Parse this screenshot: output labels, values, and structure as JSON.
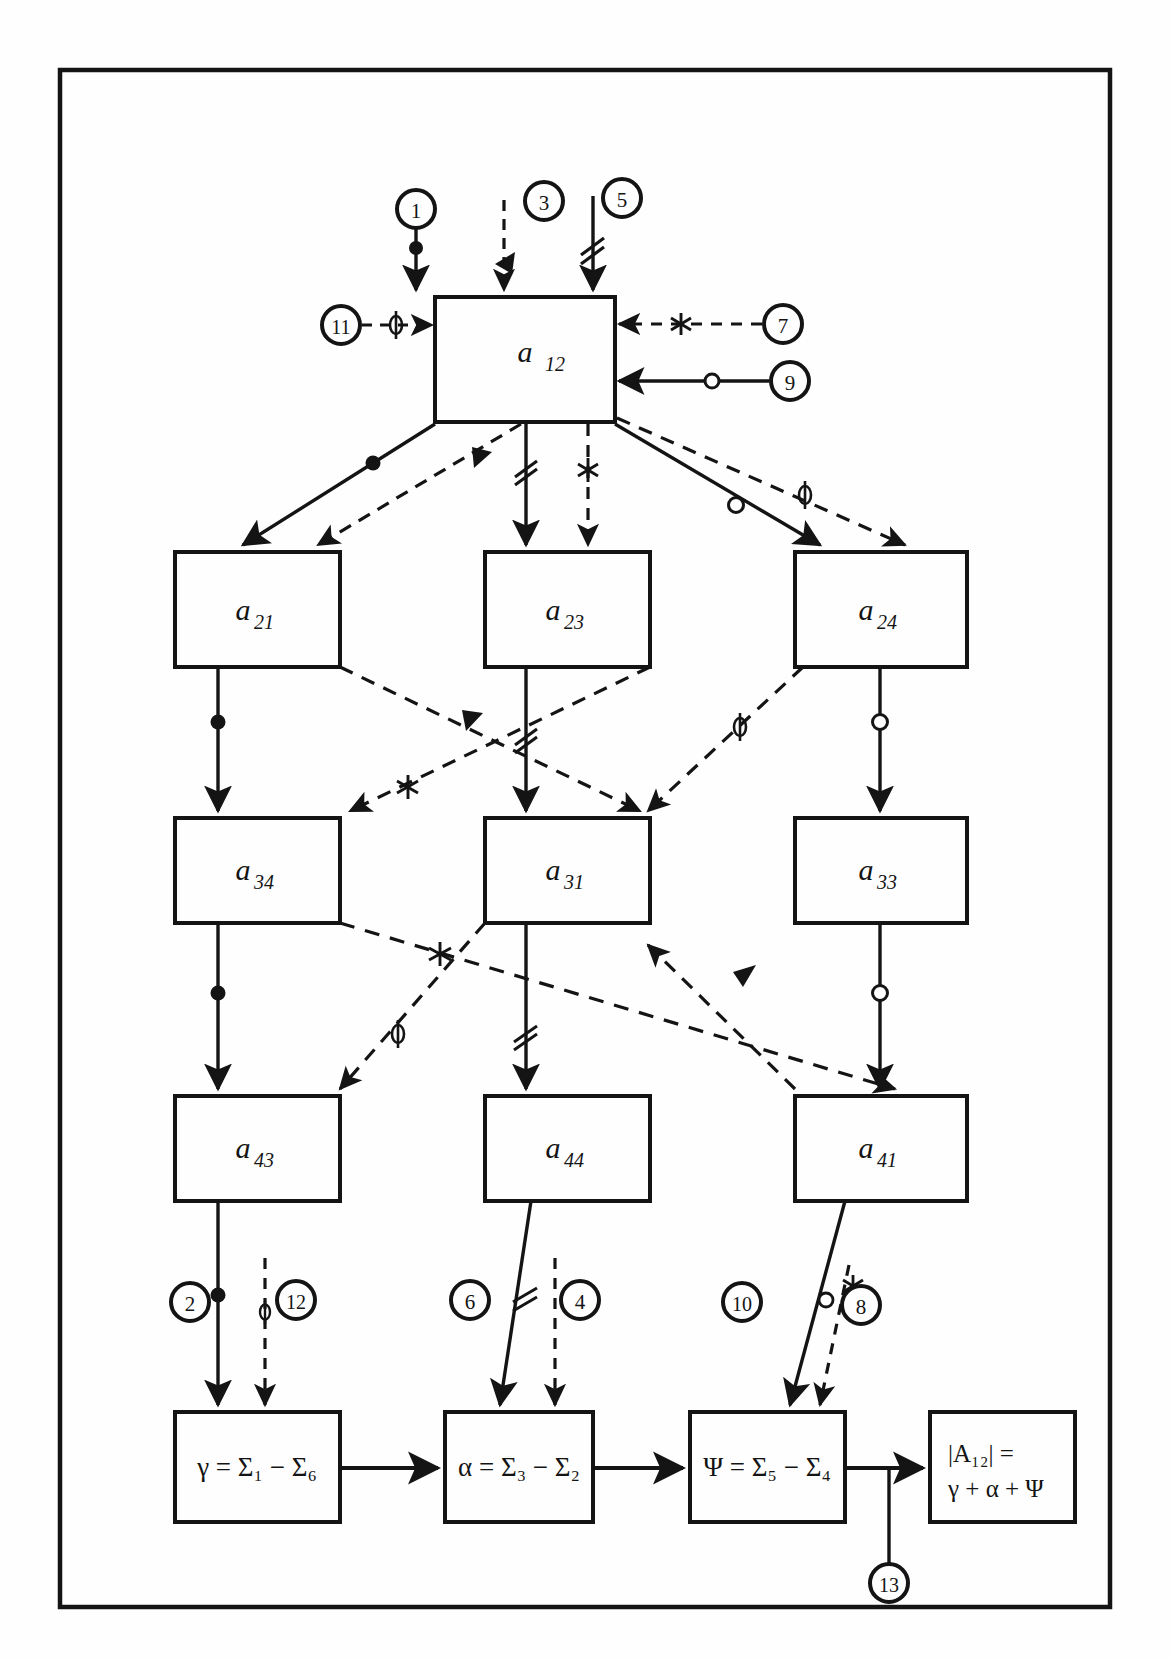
{
  "figure": {
    "type": "block-flow-diagram",
    "frame": {
      "x": 60,
      "y": 70,
      "width": 1050,
      "height": 1537
    }
  },
  "blocks": [
    {
      "id": "a12",
      "label": "a",
      "sub": "12",
      "x": 435,
      "y": 297,
      "w": 180,
      "h": 125
    },
    {
      "id": "a21",
      "label": "a",
      "sub": "21",
      "x": 175,
      "y": 552,
      "w": 165,
      "h": 115
    },
    {
      "id": "a23",
      "label": "a",
      "sub": "23",
      "x": 485,
      "y": 552,
      "w": 165,
      "h": 115
    },
    {
      "id": "a24",
      "label": "a",
      "sub": "24",
      "x": 795,
      "y": 552,
      "w": 172,
      "h": 115
    },
    {
      "id": "a34",
      "label": "a",
      "sub": "34",
      "x": 175,
      "y": 818,
      "w": 165,
      "h": 105
    },
    {
      "id": "a31",
      "label": "a",
      "sub": "31",
      "x": 485,
      "y": 818,
      "w": 165,
      "h": 105
    },
    {
      "id": "a33",
      "label": "a",
      "sub": "33",
      "x": 795,
      "y": 818,
      "w": 172,
      "h": 105
    },
    {
      "id": "a43",
      "label": "a",
      "sub": "43",
      "x": 175,
      "y": 1096,
      "w": 165,
      "h": 105
    },
    {
      "id": "a44",
      "label": "a",
      "sub": "44",
      "x": 485,
      "y": 1096,
      "w": 165,
      "h": 105
    },
    {
      "id": "a41",
      "label": "a",
      "sub": "41",
      "x": 795,
      "y": 1096,
      "w": 172,
      "h": 105
    }
  ],
  "result_blocks": [
    {
      "id": "gamma",
      "x": 175,
      "y": 1412,
      "w": 165,
      "h": 110,
      "lines": [
        "γ = Σ₁ − Σ₆"
      ]
    },
    {
      "id": "alpha",
      "x": 445,
      "y": 1412,
      "w": 148,
      "h": 110,
      "lines": [
        "α = Σ₃ − Σ₂"
      ]
    },
    {
      "id": "psi",
      "x": 690,
      "y": 1412,
      "w": 155,
      "h": 110,
      "lines": [
        "Ψ = Σ₅ − Σ₄"
      ]
    },
    {
      "id": "result",
      "x": 930,
      "y": 1412,
      "w": 145,
      "h": 110,
      "lines": [
        "|A₁₂| =",
        "γ + α + Ψ"
      ]
    }
  ],
  "nodes": [
    {
      "id": "n1",
      "label": "1",
      "cx": 416,
      "cy": 209,
      "r": 19
    },
    {
      "id": "n3",
      "label": "3",
      "cx": 544,
      "cy": 201,
      "r": 19
    },
    {
      "id": "n5",
      "label": "5",
      "cx": 622,
      "cy": 198,
      "r": 19
    },
    {
      "id": "n11",
      "label": "11",
      "cx": 341,
      "cy": 325,
      "r": 19
    },
    {
      "id": "n7",
      "label": "7",
      "cx": 783,
      "cy": 324,
      "r": 19
    },
    {
      "id": "n9",
      "label": "9",
      "cx": 790,
      "cy": 381,
      "r": 19
    },
    {
      "id": "n2",
      "label": "2",
      "cx": 190,
      "cy": 1302,
      "r": 19
    },
    {
      "id": "n12",
      "label": "12",
      "cx": 296,
      "cy": 1300,
      "r": 19
    },
    {
      "id": "n6",
      "label": "6",
      "cx": 470,
      "cy": 1300,
      "r": 19
    },
    {
      "id": "n4",
      "label": "4",
      "cx": 580,
      "cy": 1300,
      "r": 19
    },
    {
      "id": "n10",
      "label": "10",
      "cx": 742,
      "cy": 1302,
      "r": 19
    },
    {
      "id": "n8",
      "label": "8",
      "cx": 861,
      "cy": 1305,
      "r": 19
    },
    {
      "id": "n13",
      "label": "13",
      "cx": 889,
      "cy": 1583,
      "r": 19
    }
  ],
  "markers": {
    "dot": "filled-dot-marker",
    "triangle": "solid-triangle-marker",
    "doubleslash": "double-slash-marker",
    "asterisk": "asterisk-marker",
    "circle": "open-circle-marker",
    "phi": "phi-marker"
  },
  "edges": [
    {
      "id": "e-n1-a12",
      "style": "solid",
      "marker": "dot",
      "from": "n1",
      "to": "a12"
    },
    {
      "id": "e-n3-a12",
      "style": "dashed",
      "marker": "triangle",
      "from": "n3",
      "to": "a12"
    },
    {
      "id": "e-n5-a12",
      "style": "solid",
      "marker": "doubleslash",
      "from": "n5",
      "to": "a12"
    },
    {
      "id": "e-n11-a12",
      "style": "dashed",
      "marker": "phi",
      "from": "n11",
      "to": "a12"
    },
    {
      "id": "e-n7-a12",
      "style": "dashed",
      "marker": "asterisk",
      "from": "n7",
      "to": "a12"
    },
    {
      "id": "e-n9-a12",
      "style": "solid",
      "marker": "circle",
      "from": "n9",
      "to": "a12"
    },
    {
      "id": "e-a12-a21",
      "style": "solid",
      "marker": "dot",
      "from": "a12",
      "to": "a21"
    },
    {
      "id": "e-a12-a21b",
      "style": "dashed",
      "marker": "triangle",
      "from": "a12",
      "to": "a21"
    },
    {
      "id": "e-a12-a23",
      "style": "solid",
      "marker": "doubleslash",
      "from": "a12",
      "to": "a23"
    },
    {
      "id": "e-a12-a23b",
      "style": "dashed",
      "marker": "asterisk",
      "from": "a12",
      "to": "a23"
    },
    {
      "id": "e-a12-a24",
      "style": "solid",
      "marker": "circle",
      "from": "a12",
      "to": "a24"
    },
    {
      "id": "e-a12-a24b",
      "style": "dashed",
      "marker": "phi",
      "from": "a12",
      "to": "a24"
    },
    {
      "id": "e-a21-a34",
      "style": "solid",
      "marker": "dot",
      "from": "a21",
      "to": "a34"
    },
    {
      "id": "e-a21-a31",
      "style": "dashed",
      "marker": "triangle",
      "from": "a21",
      "to": "a31"
    },
    {
      "id": "e-a23-a31",
      "style": "solid",
      "marker": "doubleslash",
      "from": "a23",
      "to": "a31"
    },
    {
      "id": "e-a23-a34",
      "style": "dashed",
      "marker": "asterisk",
      "from": "a23",
      "to": "a34"
    },
    {
      "id": "e-a24-a33",
      "style": "solid",
      "marker": "circle",
      "from": "a24",
      "to": "a33"
    },
    {
      "id": "e-a24-a31",
      "style": "dashed",
      "marker": "phi",
      "from": "a24",
      "to": "a31"
    },
    {
      "id": "e-a34-a43",
      "style": "solid",
      "marker": "dot",
      "from": "a34",
      "to": "a43"
    },
    {
      "id": "e-a34-a41",
      "style": "dashed",
      "marker": "asterisk",
      "from": "a34",
      "to": "a41"
    },
    {
      "id": "e-a31-a44",
      "style": "solid",
      "marker": "doubleslash",
      "from": "a31",
      "to": "a44"
    },
    {
      "id": "e-a31-a43",
      "style": "dashed",
      "marker": "phi",
      "from": "a31",
      "to": "a43"
    },
    {
      "id": "e-a33-a41",
      "style": "solid",
      "marker": "circle",
      "from": "a33",
      "to": "a41"
    },
    {
      "id": "e-a33-a44",
      "style": "dashed",
      "marker": "triangle",
      "from": "a33",
      "to": "a44"
    },
    {
      "id": "e-a43-g",
      "style": "solid",
      "marker": "dot",
      "from": "a43",
      "to": "gamma"
    },
    {
      "id": "e-n12-g",
      "style": "dashed",
      "marker": "phi",
      "from": "n12",
      "to": "gamma"
    },
    {
      "id": "e-a44-al",
      "style": "solid",
      "marker": "doubleslash",
      "from": "a44",
      "to": "alpha"
    },
    {
      "id": "e-n4-al",
      "style": "dashed",
      "marker": "none",
      "from": "n4",
      "to": "alpha"
    },
    {
      "id": "e-a41-psi",
      "style": "solid",
      "marker": "circle",
      "from": "a41",
      "to": "psi"
    },
    {
      "id": "e-n8-psi",
      "style": "dashed",
      "marker": "asterisk",
      "from": "n8",
      "to": "psi"
    },
    {
      "id": "e-g-al",
      "style": "solid",
      "marker": "none",
      "from": "gamma",
      "to": "alpha"
    },
    {
      "id": "e-al-psi",
      "style": "solid",
      "marker": "none",
      "from": "alpha",
      "to": "psi"
    },
    {
      "id": "e-psi-res",
      "style": "solid",
      "marker": "none",
      "from": "psi",
      "to": "result"
    }
  ],
  "colors": {
    "ink": "#141414",
    "paper": "#fefefe"
  }
}
